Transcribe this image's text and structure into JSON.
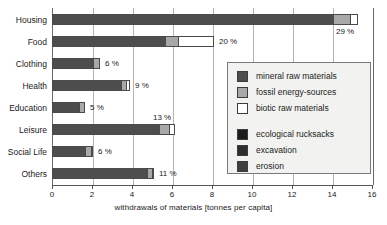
{
  "chart_data": {
    "type": "bar",
    "orientation": "horizontal",
    "stacked": true,
    "title": "",
    "xlabel": "withdrawals of materials [tonnes per capita]",
    "ylabel": "",
    "xlim": [
      0,
      16
    ],
    "xticks": [
      0,
      2,
      4,
      6,
      8,
      10,
      12,
      14,
      16
    ],
    "xtick_labels": [
      "0",
      "2",
      "4",
      "6",
      "8",
      "10",
      "12",
      "14",
      "16"
    ],
    "grid": true,
    "legend_position": "inside-right",
    "categories": [
      "Housing",
      "Food",
      "Clothing",
      "Health",
      "Education",
      "Leisure",
      "Social Life",
      "Others"
    ],
    "series": [
      {
        "name": "mineral raw materials",
        "color": "#4d4d4d",
        "values": [
          14.0,
          5.6,
          2.0,
          3.4,
          1.3,
          5.3,
          1.6,
          4.7
        ]
      },
      {
        "name": "fossil energy-sources",
        "color": "#a8a8a8",
        "values": [
          0.85,
          0.65,
          0.3,
          0.25,
          0.25,
          0.5,
          0.3,
          0.25
        ]
      },
      {
        "name": "biotic raw materials",
        "color": "#ffffff",
        "values": [
          0.35,
          1.75,
          0.0,
          0.15,
          0.0,
          0.25,
          0.05,
          0.05
        ]
      }
    ],
    "segment_breakdown": [
      {
        "category": "Housing",
        "mineral_raw_materials": 14.0,
        "fossil_energy_sources": 0.85,
        "biotic_raw_materials": 0.35,
        "total": 15.2,
        "percent_label": "29 %"
      },
      {
        "category": "Food",
        "mineral_raw_materials": 5.6,
        "fossil_energy_sources": 0.65,
        "biotic_raw_materials": 1.75,
        "total": 8.0,
        "percent_label": "20 %"
      },
      {
        "category": "Clothing",
        "mineral_raw_materials": 2.0,
        "fossil_energy_sources": 0.3,
        "biotic_raw_materials": 0.0,
        "total": 2.3,
        "percent_label": "6 %"
      },
      {
        "category": "Health",
        "mineral_raw_materials": 3.4,
        "fossil_energy_sources": 0.25,
        "biotic_raw_materials": 0.15,
        "total": 3.8,
        "percent_label": "9 %"
      },
      {
        "category": "Education",
        "mineral_raw_materials": 1.3,
        "fossil_energy_sources": 0.25,
        "biotic_raw_materials": 0.0,
        "total": 1.55,
        "percent_label": "5 %"
      },
      {
        "category": "Leisure",
        "mineral_raw_materials": 5.3,
        "fossil_energy_sources": 0.5,
        "biotic_raw_materials": 0.25,
        "total": 6.05,
        "percent_label": "13 %"
      },
      {
        "category": "Social Life",
        "mineral_raw_materials": 1.6,
        "fossil_energy_sources": 0.3,
        "biotic_raw_materials": 0.05,
        "total": 1.95,
        "percent_label": "6 %"
      },
      {
        "category": "Others",
        "mineral_raw_materials": 4.7,
        "fossil_energy_sources": 0.25,
        "biotic_raw_materials": 0.05,
        "total": 5.0,
        "percent_label": "11 %"
      }
    ],
    "percent_labels": [
      "29 %",
      "20 %",
      "6 %",
      "9 %",
      "5 %",
      "13 %",
      "6 %",
      "11 %"
    ],
    "legend": {
      "groups": [
        {
          "entries": [
            {
              "label": "mineral raw materials",
              "color": "#4d4d4d"
            },
            {
              "label": "fossil energy-sources",
              "color": "#a8a8a8"
            },
            {
              "label": "biotic raw materials",
              "color": "#ffffff"
            }
          ]
        },
        {
          "entries": [
            {
              "label": "ecological rucksacks",
              "color": "#1c1c1c"
            },
            {
              "label": "excavation",
              "color": "#2e2e2e"
            },
            {
              "label": "erosion",
              "color": "#3f3f3f"
            }
          ]
        }
      ]
    }
  },
  "colors": {
    "mineral": "#4d4d4d",
    "fossil": "#a8a8a8",
    "biotic": "#ffffff",
    "rucksacks": "#1c1c1c",
    "excavation": "#2e2e2e",
    "erosion": "#3f3f3f",
    "grid": "#b4b4b4",
    "axis": "#555555",
    "legend_bg": "#f2f2f0",
    "legend_border": "#7a7a7a",
    "text": "#1a1a1a"
  }
}
